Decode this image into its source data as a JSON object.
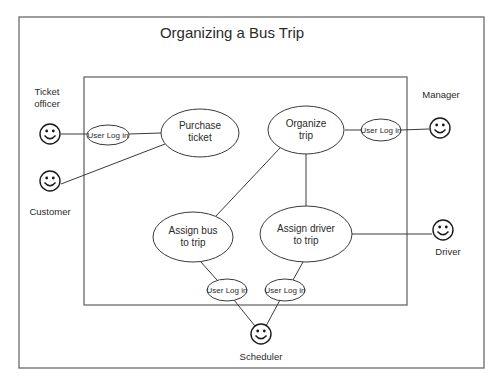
{
  "title": "Organizing a Bus Trip",
  "colors": {
    "background": "#ffffff",
    "frame": "#6a6a6a",
    "stroke": "#3a3a3a",
    "text": "#2a2a2a"
  },
  "actors": {
    "ticket_officer": {
      "label_line1": "Ticket",
      "label_line2": "officer",
      "icon": "smiley-face-icon"
    },
    "customer": {
      "label": "Customer",
      "icon": "smiley-face-icon"
    },
    "manager": {
      "label": "Manager",
      "icon": "smiley-face-icon"
    },
    "driver": {
      "label": "Driver",
      "icon": "smiley-face-icon"
    },
    "scheduler": {
      "label": "Scheduler",
      "icon": "smiley-face-icon"
    }
  },
  "use_cases": {
    "purchase_ticket": {
      "line1": "Purchase",
      "line2": "ticket"
    },
    "organize_trip": {
      "line1": "Organize",
      "line2": "trip"
    },
    "assign_bus": {
      "line1": "Assign bus",
      "line2": "to trip"
    },
    "assign_driver": {
      "line1": "Assign driver",
      "line2": "to trip"
    }
  },
  "logins": {
    "ticket_officer": "User Log in",
    "manager": "User Log in",
    "scheduler_bus": "User Log in",
    "scheduler_driver": "User Log in"
  }
}
